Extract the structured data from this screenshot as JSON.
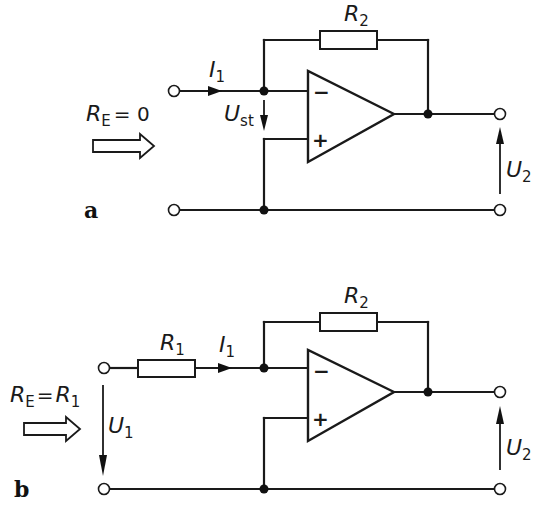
{
  "figure": {
    "circuit_a": {
      "panel_label": "a",
      "input_resistance": {
        "symbol": "R",
        "sub": "E",
        "relation": "= 0"
      },
      "feedback_resistor": {
        "symbol": "R",
        "sub": "2"
      },
      "input_current": {
        "symbol": "I",
        "sub": "1"
      },
      "differential_voltage": {
        "symbol": "U",
        "sub": "st"
      },
      "output_voltage": {
        "symbol": "U",
        "sub": "2"
      },
      "inverting_input_sign": "−",
      "noninverting_input_sign": "+"
    },
    "circuit_b": {
      "panel_label": "b",
      "input_resistance": {
        "symbol": "R",
        "sub": "E",
        "relation": "=",
        "rhs_symbol": "R",
        "rhs_sub": "1"
      },
      "input_resistor": {
        "symbol": "R",
        "sub": "1"
      },
      "feedback_resistor": {
        "symbol": "R",
        "sub": "2"
      },
      "input_current": {
        "symbol": "I",
        "sub": "1"
      },
      "input_voltage": {
        "symbol": "U",
        "sub": "1"
      },
      "output_voltage": {
        "symbol": "U",
        "sub": "2"
      },
      "inverting_input_sign": "−",
      "noninverting_input_sign": "+"
    }
  }
}
